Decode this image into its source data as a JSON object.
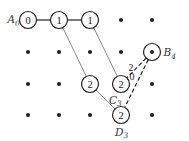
{
  "diagram": {
    "type": "grid-path-counting",
    "colors": {
      "stroke": "#222222",
      "gray_line": "#8a8a8a",
      "dot": "#222222",
      "background": "#ffffff"
    },
    "grid": {
      "cols_x": [
        28,
        59,
        90,
        121,
        152
      ],
      "rows_y": [
        20,
        52,
        84,
        115
      ]
    },
    "nodes": [
      {
        "id": "A0",
        "col": 0,
        "row": 0,
        "value": "0",
        "label": "A",
        "sub": "0",
        "label_pos": "left"
      },
      {
        "id": "n01",
        "col": 1,
        "row": 0,
        "value": "1"
      },
      {
        "id": "n02",
        "col": 2,
        "row": 0,
        "value": "1"
      },
      {
        "id": "n22",
        "col": 2,
        "row": 2,
        "value": "2"
      },
      {
        "id": "C3",
        "col": 3,
        "row": 2,
        "value": "2",
        "label": "C",
        "sub": "3",
        "label_pos": "below-left"
      },
      {
        "id": "D3",
        "col": 3,
        "row": 3,
        "value": "2",
        "label": "D",
        "sub": "3",
        "label_pos": "below"
      },
      {
        "id": "B4",
        "col": 4,
        "row": 1,
        "value": "",
        "label": "B",
        "sub": "4",
        "label_pos": "right",
        "dotted": true
      }
    ],
    "dots": [
      [
        3,
        0
      ],
      [
        4,
        0
      ],
      [
        0,
        1
      ],
      [
        1,
        1
      ],
      [
        2,
        1
      ],
      [
        3,
        1
      ],
      [
        0,
        2
      ],
      [
        1,
        2
      ],
      [
        4,
        2
      ],
      [
        0,
        3
      ],
      [
        1,
        3
      ],
      [
        2,
        3
      ],
      [
        4,
        3
      ]
    ],
    "edges_solid": [
      [
        "A0",
        "n01"
      ],
      [
        "n01",
        "n02"
      ]
    ],
    "edges_gray": [
      [
        "n01",
        "n22"
      ],
      [
        "n02",
        "C3"
      ],
      [
        "n22",
        "D3"
      ]
    ],
    "edges_dashed": [
      [
        "B4",
        "C3"
      ],
      [
        "B4",
        "D3"
      ]
    ],
    "edge_labels": [
      {
        "text": "2",
        "x": 131,
        "y": 71
      },
      {
        "text": "0",
        "x": 132,
        "y": 80
      }
    ]
  }
}
